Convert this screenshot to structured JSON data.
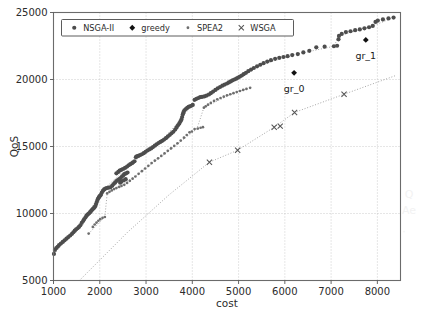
{
  "chart_data": {
    "type": "scatter",
    "title": "",
    "xlabel": "cost",
    "ylabel": "QoS",
    "xlim": [
      1000,
      8500
    ],
    "ylim": [
      5000,
      25000
    ],
    "xticks": [
      1000,
      2000,
      3000,
      4000,
      5000,
      6000,
      7000,
      8000
    ],
    "yticks": [
      5000,
      10000,
      15000,
      20000,
      25000
    ],
    "xtick_labels": [
      "1000",
      "2000",
      "3000",
      "4000",
      "5000",
      "6000",
      "7000",
      "8000"
    ],
    "ytick_labels": [
      "5000",
      "10000",
      "15000",
      "20000",
      "25000"
    ],
    "grid": true,
    "legend_position": "upper left",
    "legend_entries": [
      {
        "label": "NSGA-II",
        "marker": "circle",
        "color": "#4d4d4d"
      },
      {
        "label": "greedy",
        "marker": "diamond",
        "color": "#111111"
      },
      {
        "label": "SPEA2",
        "marker": "circle-small",
        "color": "#6e6e6e"
      },
      {
        "label": "WSGA",
        "marker": "x",
        "color": "#555555"
      }
    ],
    "annotations": [
      {
        "text": "gr_0",
        "x": 6200,
        "y": 20500,
        "dx": 0,
        "dy": -620
      },
      {
        "text": "gr_1",
        "x": 7750,
        "y": 22950,
        "dx": 0,
        "dy": -620
      }
    ],
    "series": [
      {
        "name": "NSGA-II",
        "marker": "circle",
        "color": "#4d4d4d",
        "points": [
          [
            1010,
            6980
          ],
          [
            1030,
            7280
          ],
          [
            1060,
            7420
          ],
          [
            1090,
            7520
          ],
          [
            1120,
            7640
          ],
          [
            1160,
            7760
          ],
          [
            1200,
            7880
          ],
          [
            1240,
            8000
          ],
          [
            1280,
            8120
          ],
          [
            1320,
            8240
          ],
          [
            1360,
            8360
          ],
          [
            1400,
            8480
          ],
          [
            1430,
            8600
          ],
          [
            1460,
            8720
          ],
          [
            1490,
            8820
          ],
          [
            1520,
            8900
          ],
          [
            1550,
            9000
          ],
          [
            1580,
            9120
          ],
          [
            1610,
            9300
          ],
          [
            1640,
            9440
          ],
          [
            1660,
            9560
          ],
          [
            1690,
            9700
          ],
          [
            1710,
            9820
          ],
          [
            1730,
            9900
          ],
          [
            1750,
            9960
          ],
          [
            1770,
            10020
          ],
          [
            1790,
            10100
          ],
          [
            1810,
            10180
          ],
          [
            1830,
            10260
          ],
          [
            1850,
            10330
          ],
          [
            1870,
            10400
          ],
          [
            1890,
            10480
          ],
          [
            1905,
            10560
          ],
          [
            1920,
            10700
          ],
          [
            1935,
            10860
          ],
          [
            1950,
            11000
          ],
          [
            1965,
            11120
          ],
          [
            1980,
            11200
          ],
          [
            1995,
            11280
          ],
          [
            2010,
            11340
          ],
          [
            2025,
            11400
          ],
          [
            2045,
            11560
          ],
          [
            2070,
            11700
          ],
          [
            2095,
            11800
          ],
          [
            2120,
            11860
          ],
          [
            2150,
            11900
          ],
          [
            2190,
            11930
          ],
          [
            2230,
            11960
          ],
          [
            2270,
            12080
          ],
          [
            2300,
            12200
          ],
          [
            2330,
            12300
          ],
          [
            2360,
            12420
          ],
          [
            2390,
            12500
          ],
          [
            2420,
            12560
          ],
          [
            2450,
            12640
          ],
          [
            2480,
            12760
          ],
          [
            2510,
            12860
          ],
          [
            2540,
            12960
          ],
          [
            2570,
            13000
          ],
          [
            2600,
            13060
          ],
          [
            2440,
            12300
          ],
          [
            2470,
            12380
          ],
          [
            2520,
            12480
          ],
          [
            2560,
            12560
          ],
          [
            2360,
            13000
          ],
          [
            2400,
            13100
          ],
          [
            2430,
            13200
          ],
          [
            2465,
            13260
          ],
          [
            2500,
            13320
          ],
          [
            2545,
            13400
          ],
          [
            2590,
            13500
          ],
          [
            2625,
            13600
          ],
          [
            2660,
            13680
          ],
          [
            2700,
            13760
          ],
          [
            2720,
            13820
          ],
          [
            2750,
            13900
          ],
          [
            2780,
            14200
          ],
          [
            2800,
            14260
          ],
          [
            2830,
            14300
          ],
          [
            2870,
            14360
          ],
          [
            2910,
            14420
          ],
          [
            2950,
            14500
          ],
          [
            2990,
            14600
          ],
          [
            3030,
            14700
          ],
          [
            3070,
            14780
          ],
          [
            3110,
            14860
          ],
          [
            3150,
            14960
          ],
          [
            3190,
            15060
          ],
          [
            3230,
            15160
          ],
          [
            3270,
            15260
          ],
          [
            3310,
            15340
          ],
          [
            3350,
            15420
          ],
          [
            3390,
            15520
          ],
          [
            3430,
            15620
          ],
          [
            3470,
            15740
          ],
          [
            3510,
            15860
          ],
          [
            3550,
            15980
          ],
          [
            3590,
            16100
          ],
          [
            3630,
            16260
          ],
          [
            3660,
            16420
          ],
          [
            3690,
            16580
          ],
          [
            3720,
            16720
          ],
          [
            3745,
            16880
          ],
          [
            3765,
            17020
          ],
          [
            3780,
            17200
          ],
          [
            3795,
            17400
          ],
          [
            3810,
            17560
          ],
          [
            3830,
            17700
          ],
          [
            3860,
            17800
          ],
          [
            3890,
            17880
          ],
          [
            3920,
            17960
          ],
          [
            3950,
            18000
          ],
          [
            3980,
            18040
          ],
          [
            4010,
            18100
          ],
          [
            4050,
            18480
          ],
          [
            4090,
            18560
          ],
          [
            4130,
            18620
          ],
          [
            4170,
            18680
          ],
          [
            4210,
            18700
          ],
          [
            4260,
            18740
          ],
          [
            4310,
            18800
          ],
          [
            4360,
            18880
          ],
          [
            4400,
            18980
          ],
          [
            4450,
            19100
          ],
          [
            4500,
            19220
          ],
          [
            4550,
            19340
          ],
          [
            4600,
            19440
          ],
          [
            4650,
            19540
          ],
          [
            4700,
            19620
          ],
          [
            4750,
            19700
          ],
          [
            4790,
            19780
          ],
          [
            4830,
            19860
          ],
          [
            4870,
            19940
          ],
          [
            4910,
            20000
          ],
          [
            4950,
            20060
          ],
          [
            4990,
            20140
          ],
          [
            5030,
            20220
          ],
          [
            5070,
            20300
          ],
          [
            5110,
            20400
          ],
          [
            5160,
            20500
          ],
          [
            5210,
            20620
          ],
          [
            5270,
            20740
          ],
          [
            5330,
            20860
          ],
          [
            5400,
            20980
          ],
          [
            5470,
            21100
          ],
          [
            5540,
            21220
          ],
          [
            5620,
            21340
          ],
          [
            5700,
            21440
          ],
          [
            5790,
            21540
          ],
          [
            5880,
            21620
          ],
          [
            5970,
            21680
          ],
          [
            6060,
            21740
          ],
          [
            6160,
            21820
          ],
          [
            6280,
            21900
          ],
          [
            6400,
            22020
          ],
          [
            6530,
            22140
          ],
          [
            6680,
            22400
          ],
          [
            6860,
            22450
          ],
          [
            7060,
            22480
          ],
          [
            7130,
            22520
          ],
          [
            7160,
            23000
          ],
          [
            7170,
            23250
          ],
          [
            7230,
            23400
          ],
          [
            7320,
            23540
          ],
          [
            7420,
            23600
          ],
          [
            7520,
            23680
          ],
          [
            7620,
            23740
          ],
          [
            7720,
            23820
          ],
          [
            7820,
            23900
          ],
          [
            7900,
            24000
          ],
          [
            7960,
            24300
          ],
          [
            8010,
            24400
          ],
          [
            8120,
            24480
          ],
          [
            8240,
            24560
          ],
          [
            8350,
            24620
          ]
        ]
      },
      {
        "name": "SPEA2",
        "marker": "circle-small",
        "color": "#6e6e6e",
        "points": [
          [
            1760,
            8500
          ],
          [
            1850,
            9000
          ],
          [
            1890,
            9180
          ],
          [
            1930,
            9320
          ],
          [
            1970,
            9460
          ],
          [
            2010,
            9580
          ],
          [
            2060,
            9680
          ],
          [
            2110,
            9740
          ],
          [
            2160,
            11500
          ],
          [
            2210,
            11620
          ],
          [
            2260,
            11720
          ],
          [
            2310,
            11820
          ],
          [
            2360,
            11900
          ],
          [
            2420,
            11980
          ],
          [
            2470,
            12060
          ],
          [
            2530,
            12140
          ],
          [
            2590,
            12280
          ],
          [
            2650,
            12440
          ],
          [
            2710,
            12600
          ],
          [
            2770,
            12760
          ],
          [
            2840,
            12960
          ],
          [
            2910,
            13160
          ],
          [
            2980,
            13360
          ],
          [
            3050,
            13560
          ],
          [
            3120,
            13760
          ],
          [
            3190,
            13940
          ],
          [
            3260,
            14120
          ],
          [
            3330,
            14300
          ],
          [
            3400,
            14480
          ],
          [
            3470,
            14680
          ],
          [
            3540,
            14860
          ],
          [
            3610,
            15040
          ],
          [
            3680,
            15240
          ],
          [
            3750,
            15440
          ],
          [
            3820,
            15660
          ],
          [
            3880,
            15860
          ],
          [
            3940,
            16060
          ],
          [
            3990,
            16120
          ],
          [
            4050,
            16300
          ],
          [
            4120,
            16340
          ],
          [
            4180,
            16400
          ],
          [
            4230,
            16440
          ],
          [
            4250,
            17900
          ],
          [
            4290,
            18000
          ],
          [
            4340,
            18120
          ],
          [
            4400,
            18250
          ],
          [
            4470,
            18400
          ],
          [
            4540,
            18520
          ],
          [
            4610,
            18620
          ],
          [
            4680,
            18720
          ],
          [
            4750,
            18820
          ],
          [
            4820,
            18900
          ],
          [
            4890,
            18980
          ],
          [
            4960,
            19060
          ],
          [
            5030,
            19140
          ],
          [
            5100,
            19220
          ],
          [
            5170,
            19300
          ],
          [
            5250,
            19380
          ]
        ]
      },
      {
        "name": "WSGA",
        "marker": "x",
        "color": "#555555",
        "points": [
          [
            4370,
            13830
          ],
          [
            4980,
            14720
          ],
          [
            5770,
            16440
          ],
          [
            5900,
            16520
          ],
          [
            6210,
            17540
          ],
          [
            7280,
            18900
          ]
        ]
      },
      {
        "name": "greedy",
        "marker": "diamond",
        "color": "#111111",
        "points": [
          [
            6200,
            20500
          ],
          [
            7750,
            22950
          ]
        ]
      }
    ],
    "trend_lines": [
      {
        "name": "nsga-trend",
        "points": [
          [
            1010,
            6980
          ],
          [
            1600,
            9300
          ],
          [
            2100,
            11860
          ],
          [
            2750,
            13900
          ],
          [
            3300,
            15300
          ],
          [
            3800,
            17200
          ],
          [
            4050,
            18480
          ],
          [
            4700,
            19620
          ],
          [
            5400,
            20980
          ],
          [
            6160,
            21820
          ],
          [
            7060,
            22480
          ],
          [
            7170,
            23250
          ],
          [
            7900,
            24000
          ],
          [
            8350,
            24620
          ]
        ]
      },
      {
        "name": "spea2-trend",
        "points": [
          [
            1760,
            8500
          ],
          [
            2110,
            9740
          ],
          [
            2160,
            11500
          ],
          [
            2800,
            12860
          ],
          [
            3500,
            14700
          ],
          [
            4100,
            16320
          ],
          [
            4250,
            17900
          ],
          [
            4900,
            19000
          ],
          [
            5250,
            19380
          ]
        ]
      },
      {
        "name": "wsga-trend",
        "points": [
          [
            1560,
            5000
          ],
          [
            2600,
            8600
          ],
          [
            3500,
            11400
          ],
          [
            4370,
            13830
          ],
          [
            4980,
            14720
          ],
          [
            5770,
            16440
          ],
          [
            6210,
            17540
          ],
          [
            7280,
            18900
          ],
          [
            8400,
            20300
          ]
        ]
      }
    ]
  }
}
